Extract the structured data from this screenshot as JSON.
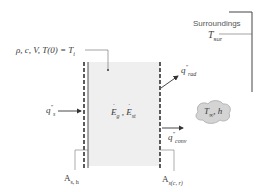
{
  "diagram": {
    "type": "lumped-capacitance energy balance schematic",
    "body": {
      "properties_label": "ρ, c, V, T(0) = T",
      "properties_sub": "i",
      "energy_gen": "E",
      "energy_gen_sub": "g",
      "separator": ",",
      "energy_st": "E",
      "energy_st_sub": "st",
      "fill_color": "#efefef"
    },
    "surroundings": {
      "label": "Surroundings",
      "temp": "T",
      "temp_sub": "sur"
    },
    "fluxes": {
      "source": {
        "symbol": "q",
        "sup": "\"",
        "sub": "s"
      },
      "radiation": {
        "symbol": "q",
        "sup": "\"",
        "sub": "rad"
      },
      "convection": {
        "symbol": "q",
        "sup": "\"",
        "sub": "conv"
      }
    },
    "fluid": {
      "temp": "T",
      "temp_sub": "∞",
      "coeff": ", h",
      "cloud_color": "#d8d8d8"
    },
    "areas": {
      "heated": {
        "symbol": "A",
        "sub": "s, h"
      },
      "cooled": {
        "symbol": "A",
        "sub": "s(c, r)"
      }
    }
  }
}
